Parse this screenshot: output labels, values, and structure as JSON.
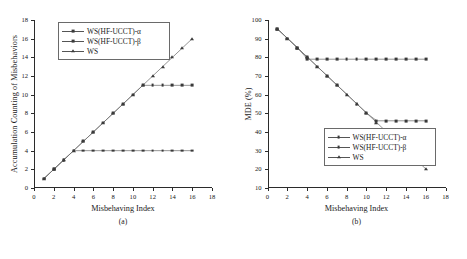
{
  "figure": {
    "panels": [
      {
        "caption": "(a)",
        "xlabel": "Misbehaving Index",
        "ylabel": "Accumulation Counting of Misbehaviors",
        "legend_position": "top-left"
      },
      {
        "caption": "(b)",
        "xlabel": "Misbehaving Index",
        "ylabel": "MDE (%)",
        "legend_position": "bottom-left"
      }
    ]
  },
  "chart_data": [
    {
      "type": "line",
      "title": "",
      "subtitle": "(a)",
      "xlabel": "Misbehaving Index",
      "ylabel": "Accumulation Counting of Misbehaviors",
      "xlim": [
        0,
        18
      ],
      "ylim": [
        0,
        18
      ],
      "xticks": [
        0,
        2,
        4,
        6,
        8,
        10,
        12,
        14,
        16,
        18
      ],
      "yticks": [
        0,
        2,
        4,
        6,
        8,
        10,
        12,
        14,
        16,
        18
      ],
      "grid": false,
      "legend_position": "upper left",
      "x": [
        1,
        2,
        3,
        4,
        5,
        6,
        7,
        8,
        9,
        10,
        11,
        12,
        13,
        14,
        15,
        16
      ],
      "series": [
        {
          "name": "WS(HF-UCCT)-α",
          "marker": "square",
          "values": [
            1,
            2,
            3,
            4,
            4,
            4,
            4,
            4,
            4,
            4,
            4,
            4,
            4,
            4,
            4,
            4
          ]
        },
        {
          "name": "WS(HF-UCCT)-β",
          "marker": "square",
          "values": [
            1,
            2,
            3,
            4,
            5,
            6,
            7,
            8,
            9,
            10,
            11,
            11,
            11,
            11,
            11,
            11
          ]
        },
        {
          "name": "WS",
          "marker": "triangle",
          "values": [
            1,
            2,
            3,
            4,
            5,
            6,
            7,
            8,
            9,
            10,
            11,
            12,
            13,
            14,
            15,
            16
          ]
        }
      ]
    },
    {
      "type": "line",
      "title": "",
      "subtitle": "(b)",
      "xlabel": "Misbehaving Index",
      "ylabel": "MDE (%)",
      "xlim": [
        0,
        18
      ],
      "ylim": [
        10,
        100
      ],
      "xticks": [
        0,
        2,
        4,
        6,
        8,
        10,
        12,
        14,
        16,
        18
      ],
      "yticks": [
        10,
        20,
        30,
        40,
        50,
        60,
        70,
        80,
        90,
        100
      ],
      "grid": false,
      "legend_position": "lower left",
      "x": [
        1,
        2,
        3,
        4,
        5,
        6,
        7,
        8,
        9,
        10,
        11,
        12,
        13,
        14,
        15,
        16
      ],
      "series": [
        {
          "name": "WS(HF-UCCT)-α",
          "marker": "square",
          "values": [
            95,
            90,
            85,
            79,
            79,
            79,
            79,
            79,
            79,
            79,
            79,
            79,
            79,
            79,
            79,
            79
          ]
        },
        {
          "name": "WS(HF-UCCT)-β",
          "marker": "square",
          "values": [
            95,
            90,
            85,
            80,
            75,
            70,
            65,
            60,
            55,
            50,
            46,
            46,
            46,
            46,
            46,
            46
          ]
        },
        {
          "name": "WS",
          "marker": "triangle",
          "values": [
            95,
            90,
            85,
            80,
            75,
            70,
            65,
            60,
            55,
            50,
            45,
            40,
            35,
            30,
            25,
            20
          ]
        }
      ]
    }
  ]
}
